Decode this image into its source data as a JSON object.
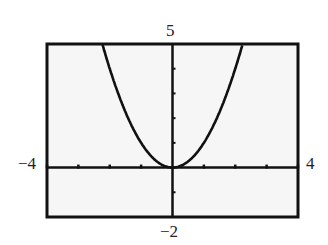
{
  "chart_data": {
    "type": "line",
    "title": "",
    "function": "y = x^2",
    "xlabel": "",
    "ylabel": "",
    "xlim": [
      -4,
      4
    ],
    "ylim": [
      -2,
      5
    ],
    "x_tick_step": 1,
    "y_tick_step": 1,
    "grid": false,
    "series": [
      {
        "name": "y = x^2",
        "x": [
          -2.236,
          -2,
          -1.5,
          -1,
          -0.5,
          0,
          0.5,
          1,
          1.5,
          2,
          2.236
        ],
        "y": [
          5,
          4,
          2.25,
          1,
          0.25,
          0,
          0.25,
          1,
          2.25,
          4,
          5
        ]
      }
    ],
    "window_labels": {
      "xmin": "−4",
      "xmax": "4",
      "ymin": "−2",
      "ymax": "5"
    }
  }
}
